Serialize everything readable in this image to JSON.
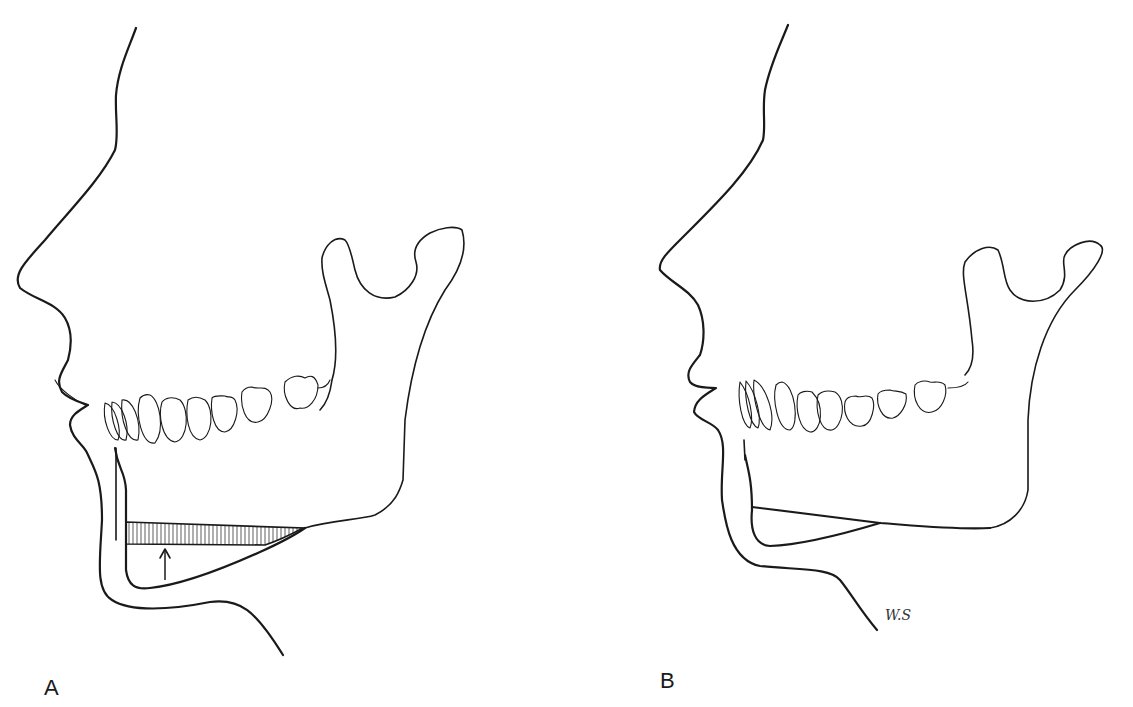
{
  "figure": {
    "panels": [
      {
        "label": "A",
        "description": "Lateral profile with mandible; hatched bone segment at inferior border, arrow pointing upward"
      },
      {
        "label": "B",
        "description": "Lateral profile after repositioning; segment fixed along mandibular border"
      }
    ],
    "signature": "W.S",
    "colors": {
      "line": "#1a1a1a",
      "background": "#ffffff"
    }
  }
}
